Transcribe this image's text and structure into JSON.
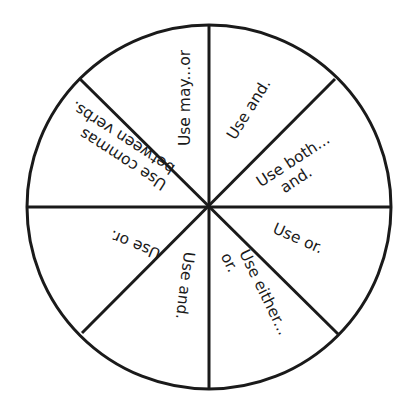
{
  "diagram": {
    "type": "spinner-wheel",
    "segment_count": 8,
    "colors": {
      "stroke": "#1a1a1a",
      "fill": "#ffffff",
      "text": "#1a1a1a"
    },
    "segments": [
      {
        "position": "top-left",
        "lines": [
          "Use may...or"
        ]
      },
      {
        "position": "top-right",
        "lines": [
          "Use and."
        ]
      },
      {
        "position": "right-upper",
        "lines": [
          "Use both...",
          "and."
        ]
      },
      {
        "position": "right-lower",
        "lines": [
          "Use or."
        ]
      },
      {
        "position": "bottom-right",
        "lines": [
          "Use either...",
          "or."
        ]
      },
      {
        "position": "bottom-left",
        "lines": [
          "Use and."
        ]
      },
      {
        "position": "left-lower",
        "lines": [
          "Use or."
        ]
      },
      {
        "position": "left-upper",
        "lines": [
          "Use commas",
          "between verbs."
        ]
      }
    ]
  }
}
